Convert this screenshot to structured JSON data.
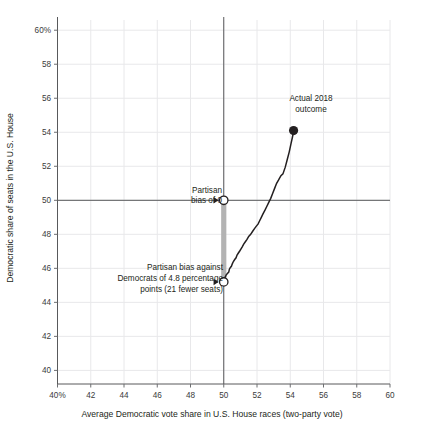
{
  "chart_data": {
    "type": "line",
    "title": "",
    "subtitle": "",
    "xlabel": "Average Democratic vote share in U.S. House races (two-party vote)",
    "ylabel": "Democratic share of seats in the U.S. House",
    "xlim": [
      40,
      60
    ],
    "ylim": [
      39.2,
      60.6
    ],
    "xticks": [
      40,
      42,
      44,
      46,
      48,
      50,
      52,
      54,
      56,
      58,
      60
    ],
    "xtick_labels": [
      "40%",
      "42",
      "44",
      "46",
      "48",
      "50",
      "52",
      "54",
      "56",
      "58",
      "60"
    ],
    "yticks": [
      40,
      42,
      44,
      46,
      48,
      50,
      52,
      54,
      56,
      58,
      60
    ],
    "ytick_labels": [
      "40",
      "42",
      "44",
      "46",
      "48",
      "50",
      "52",
      "54",
      "56",
      "58",
      "60%"
    ],
    "grid": true,
    "legend": "none",
    "series": [
      {
        "name": "Seats-votes curve",
        "color": "#231f20",
        "x": [
          50.0,
          50.05,
          50.1,
          50.15,
          50.22,
          50.3,
          50.34,
          50.4,
          50.46,
          50.52,
          50.58,
          50.66,
          50.74,
          50.8,
          50.88,
          50.96,
          51.04,
          51.12,
          51.2,
          51.3,
          51.4,
          51.5,
          51.62,
          51.74,
          51.86,
          51.96,
          52.06,
          52.16,
          52.26,
          52.36,
          52.48,
          52.58,
          52.7,
          52.82,
          52.94,
          53.06,
          53.18,
          53.3,
          53.44,
          53.56,
          53.7,
          53.82,
          53.94,
          54.04,
          54.14,
          54.2
        ],
        "y": [
          45.2,
          45.45,
          45.5,
          45.62,
          45.7,
          45.78,
          45.95,
          46.05,
          46.12,
          46.28,
          46.4,
          46.52,
          46.62,
          46.78,
          46.9,
          47.02,
          47.15,
          47.28,
          47.42,
          47.56,
          47.7,
          47.88,
          48.0,
          48.18,
          48.35,
          48.48,
          48.6,
          48.8,
          49.0,
          49.2,
          49.42,
          49.62,
          49.86,
          50.1,
          50.4,
          50.7,
          51.0,
          51.2,
          51.45,
          51.55,
          51.95,
          52.4,
          52.85,
          53.3,
          53.75,
          54.1
        ]
      }
    ],
    "reference_lines": [
      {
        "name": "vertical-50-vote-line",
        "axis": "x",
        "value": 50,
        "color": "#58595b"
      },
      {
        "name": "horizontal-50-seat-line",
        "axis": "y",
        "value": 50,
        "color": "#58595b"
      }
    ],
    "bias_bar": {
      "x": 50,
      "y_top": 50,
      "y_bottom": 45.2,
      "color": "#b3b3b3"
    },
    "points": [
      {
        "name": "partisan-bias-zero-marker",
        "x": 50,
        "y": 50,
        "style": "open-circle"
      },
      {
        "name": "partisan-bias-actual-marker",
        "x": 50,
        "y": 45.2,
        "style": "open-circle"
      },
      {
        "name": "actual-2018-outcome-marker",
        "x": 54.2,
        "y": 54.1,
        "style": "filled-circle"
      }
    ],
    "annotations": [
      {
        "name": "partisan-bias-zero-annotation",
        "lines": [
          "Partisan",
          "bias of 0"
        ],
        "target_x": 50,
        "target_y": 50
      },
      {
        "name": "partisan-bias-actual-annotation",
        "lines": [
          "Partisan bias against",
          "Democrats of 4.8 percentage",
          "points (21 fewer seats)"
        ],
        "target_x": 50,
        "target_y": 45.2
      },
      {
        "name": "actual-2018-outcome-annotation",
        "lines": [
          "Actual 2018",
          "outcome"
        ],
        "target_x": 54.2,
        "target_y": 54.1
      }
    ]
  },
  "labels": {
    "ylabel": "Democratic share of seats in the U.S. House",
    "xlabel": "Average Democratic vote share in U.S. House races (two-party vote)",
    "ytick_0": "40",
    "ytick_1": "42",
    "ytick_2": "44",
    "ytick_3": "46",
    "ytick_4": "48",
    "ytick_5": "50",
    "ytick_6": "52",
    "ytick_7": "54",
    "ytick_8": "56",
    "ytick_9": "58",
    "ytick_10": "60%",
    "xtick_0": "40%",
    "xtick_1": "42",
    "xtick_2": "44",
    "xtick_3": "46",
    "xtick_4": "48",
    "xtick_5": "50",
    "xtick_6": "52",
    "xtick_7": "54",
    "xtick_8": "56",
    "xtick_9": "58",
    "xtick_10": "60",
    "annot_bias0_l1": "Partisan",
    "annot_bias0_l2": "bias of 0",
    "annot_bias_l1": "Partisan bias against",
    "annot_bias_l2": "Democrats of 4.8 percentage",
    "annot_bias_l3": "points (21 fewer seats)",
    "annot_actual_l1": "Actual 2018",
    "annot_actual_l2": "outcome"
  },
  "colors": {
    "curve": "#231f20",
    "reference_line": "#58595b",
    "grid": "#e8e8ea",
    "bias_bar": "#b3b3b3",
    "text": "#231f20",
    "tick_text": "#3b3b3b",
    "background": "#ffffff"
  }
}
